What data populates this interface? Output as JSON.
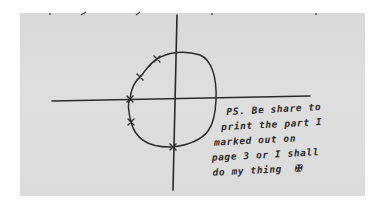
{
  "image": {
    "description": "Photocopied handwritten sketch: a cross of axes with a roughly circular loop marked with X points, and a handwritten note",
    "paper_color": "#dcdcdc",
    "ink_color": "#2a2a2a"
  },
  "drawing": {
    "axes": {
      "horizontal": {
        "x1": 52,
        "y1": 101,
        "x2": 310,
        "y2": 96
      },
      "vertical": {
        "x1": 177,
        "y1": 15,
        "x2": 173,
        "y2": 190
      }
    },
    "x_marks": [
      {
        "x": 157,
        "y": 59
      },
      {
        "x": 140,
        "y": 77
      },
      {
        "x": 130,
        "y": 99
      },
      {
        "x": 131,
        "y": 122
      },
      {
        "x": 173,
        "y": 147
      }
    ]
  },
  "note": {
    "lines": [
      "PS. Be share to",
      "print the part I",
      "marked out on",
      "page 3 or I shall",
      "do my thing"
    ],
    "symbol": "✠"
  }
}
